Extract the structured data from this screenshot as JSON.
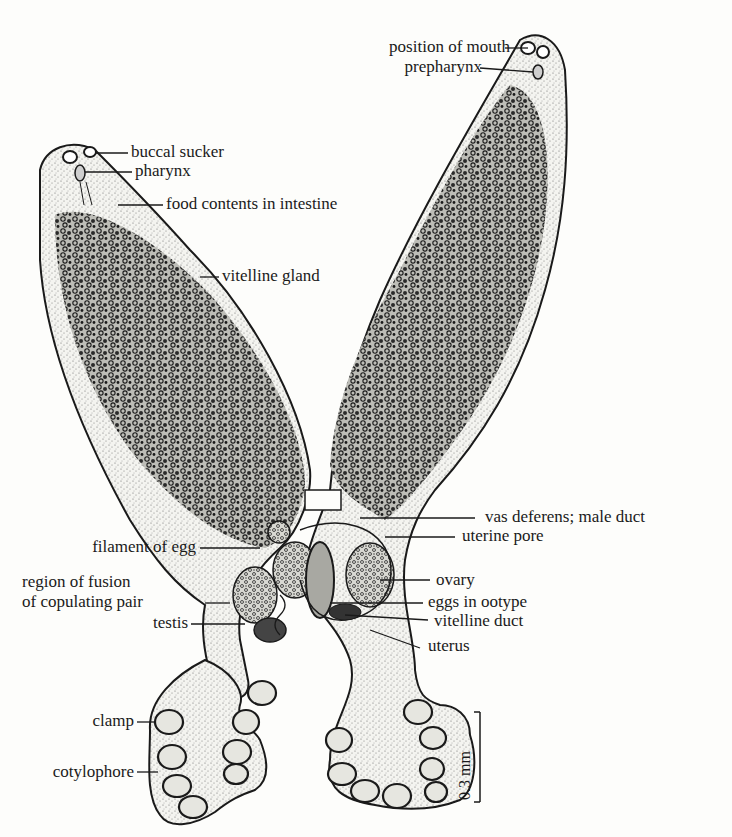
{
  "figure": {
    "ink_color": "#1a1a1a",
    "paper_color": "#fdfdfb",
    "stipple_color": "#6b6b6b"
  },
  "labels": {
    "position_of_mouth": "position of mouth",
    "prepharynx": "prepharynx",
    "buccal_sucker": "buccal sucker",
    "pharynx": "pharynx",
    "food_contents": "food contents in intestine",
    "vitelline_gland": "vitelline gland",
    "vas_deferens": "vas deferens; male duct",
    "uterine_pore": "uterine pore",
    "filament_of_egg": "filament of egg",
    "region_of_fusion_line1": "region of fusion",
    "region_of_fusion_line2": "of copulating pair",
    "ovary": "ovary",
    "eggs_in_ootype": "eggs in ootype",
    "testis": "testis",
    "vitelline_duct": "vitelline duct",
    "uterus": "uterus",
    "clamp": "clamp",
    "cotylophore": "cotylophore"
  },
  "scale_bar": {
    "label": "0.3 mm"
  }
}
